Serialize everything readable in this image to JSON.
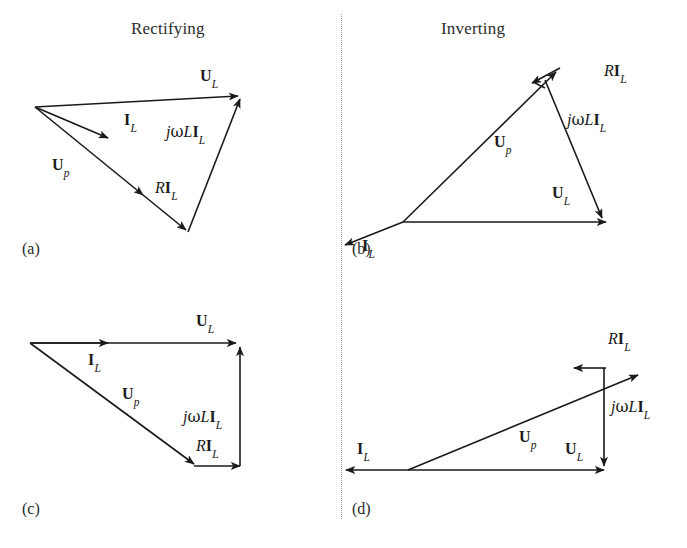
{
  "figure": {
    "width": 687,
    "height": 548,
    "background": "#ffffff",
    "stroke_color": "#1a1a1a",
    "divider": {
      "name": "vertical-dotted-divider",
      "style": "dotted",
      "color": "#9a9a9a"
    }
  },
  "columns": [
    {
      "id": "left",
      "title": "Rectifying"
    },
    {
      "id": "right",
      "title": "Inverting"
    }
  ],
  "titles": {
    "rectifying": "Rectifying",
    "inverting": "Inverting"
  },
  "captions": {
    "a": "(a)",
    "b": "(b)",
    "c": "(c)",
    "d": "(d)"
  },
  "symbols": {
    "U_L": {
      "bold": "U",
      "sub": "L",
      "plain": "U_L"
    },
    "U_p": {
      "bold": "U",
      "sub": "p",
      "plain": "U_p"
    },
    "I_L": {
      "bold": "I",
      "sub": "L",
      "plain": "I_L"
    },
    "R_I_L": {
      "italic": "R",
      "bold": "I",
      "sub": "L",
      "plain": "RI_L"
    },
    "jwL_I_L": {
      "italic_j": "j",
      "greek": "ω",
      "italic_L": "L",
      "bold": "I",
      "sub": "L",
      "plain": "jωLI_L"
    }
  },
  "panels": [
    {
      "id": "a",
      "caption": "(a)",
      "column": "Rectifying",
      "description": "Rectifying phasor triangle with tilted U_L baseline",
      "vectors": [
        {
          "name": "U_L",
          "label": "U_L",
          "from": [
            35,
            107
          ],
          "to": [
            243,
            96
          ],
          "arrow": "end"
        },
        {
          "name": "I_L",
          "label": "I_L",
          "from": [
            35,
            107
          ],
          "to": [
            113,
            140
          ],
          "arrow": "end"
        },
        {
          "name": "U_p",
          "label": "U_p",
          "from": [
            35,
            107
          ],
          "to": [
            190,
            232
          ],
          "arrow": "mid-and-end"
        },
        {
          "name": "R_I_L",
          "label": "RI_L",
          "from": [
            35,
            107
          ],
          "to": [
            190,
            232
          ],
          "arrow": "end"
        },
        {
          "name": "jwL_I_L",
          "label": "jωLI_L",
          "from": [
            190,
            232
          ],
          "to": [
            243,
            96
          ],
          "arrow": "end"
        }
      ],
      "labels": [
        {
          "name": "label-U-L",
          "symbol": "U_L",
          "x": 200,
          "y": 76
        },
        {
          "name": "label-I-L",
          "symbol": "I_L",
          "x": 124,
          "y": 118
        },
        {
          "name": "label-U-p",
          "symbol": "U_p",
          "x": 53,
          "y": 160
        },
        {
          "name": "label-jwL-I-L",
          "symbol": "jωLI_L",
          "x": 167,
          "y": 125
        },
        {
          "name": "label-R-I-L",
          "symbol": "RI_L",
          "x": 156,
          "y": 182
        }
      ]
    },
    {
      "id": "b",
      "caption": "(b)",
      "column": "Inverting",
      "description": "Inverting phasor triangle, R I_L reversed at U_p tip, I_L pointing down-left",
      "vectors": [
        {
          "name": "U_p",
          "label": "U_p",
          "from": [
            403,
            222
          ],
          "to": [
            550,
            78
          ],
          "arrow": "end"
        },
        {
          "name": "R_I_L",
          "label": "RI_L",
          "from": [
            558,
            70
          ],
          "to": [
            533,
            82
          ],
          "arrow": "end"
        },
        {
          "name": "jwL_I_L",
          "label": "jωLI_L",
          "from": [
            548,
            80
          ],
          "to": [
            604,
            218
          ],
          "arrow": "end"
        },
        {
          "name": "U_L",
          "label": "U_L",
          "from": [
            403,
            222
          ],
          "to": [
            604,
            222
          ],
          "arrow": "end"
        },
        {
          "name": "I_L",
          "label": "I_L",
          "from": [
            403,
            222
          ],
          "to": [
            344,
            245
          ],
          "arrow": "end"
        }
      ],
      "labels": [
        {
          "name": "label-R-I-L",
          "symbol": "RI_L",
          "x": 605,
          "y": 70
        },
        {
          "name": "label-jwL-I-L",
          "symbol": "jωLI_L",
          "x": 566,
          "y": 118
        },
        {
          "name": "label-U-p",
          "symbol": "U_p",
          "x": 495,
          "y": 140
        },
        {
          "name": "label-U-L",
          "symbol": "U_L",
          "x": 553,
          "y": 190
        },
        {
          "name": "label-I-L",
          "symbol": "I_L",
          "x": 362,
          "y": 243
        }
      ]
    },
    {
      "id": "c",
      "caption": "(c)",
      "column": "Rectifying",
      "description": "Rectifying phasor with horizontal U_L and vertical jwL I_L leg",
      "vectors": [
        {
          "name": "U_L",
          "label": "U_L",
          "from": [
            30,
            343
          ],
          "to": [
            238,
            343
          ],
          "arrow": "mid-and-end"
        },
        {
          "name": "I_L",
          "label": "I_L",
          "from": [
            30,
            343
          ],
          "to": [
            110,
            343
          ],
          "arrow": "end"
        },
        {
          "name": "U_p",
          "label": "U_p",
          "from": [
            30,
            343
          ],
          "to": [
            197,
            465
          ],
          "arrow": "end"
        },
        {
          "name": "R_I_L",
          "label": "RI_L",
          "from": [
            197,
            465
          ],
          "to": [
            240,
            465
          ],
          "arrow": "end"
        },
        {
          "name": "jwL_I_L",
          "label": "jωLI_L",
          "from": [
            240,
            465
          ],
          "to": [
            240,
            348
          ],
          "arrow": "end"
        }
      ],
      "labels": [
        {
          "name": "label-U-L",
          "symbol": "U_L",
          "x": 196,
          "y": 321
        },
        {
          "name": "label-I-L",
          "symbol": "I_L",
          "x": 88,
          "y": 357
        },
        {
          "name": "label-U-p",
          "symbol": "U_p",
          "x": 123,
          "y": 392
        },
        {
          "name": "label-jwL-I-L",
          "symbol": "jωLI_L",
          "x": 184,
          "y": 415
        },
        {
          "name": "label-R-I-L",
          "symbol": "RI_L",
          "x": 196,
          "y": 444
        }
      ]
    },
    {
      "id": "d",
      "caption": "(d)",
      "column": "Inverting",
      "description": "Inverting phasor with reversed I_L, vertical downward jwL I_L and reversed R I_L",
      "vectors": [
        {
          "name": "U_p",
          "label": "U_p",
          "from": [
            408,
            470
          ],
          "to": [
            638,
            378
          ],
          "arrow": "end"
        },
        {
          "name": "R_I_L",
          "label": "RI_L",
          "from": [
            604,
            368
          ],
          "to": [
            573,
            368
          ],
          "arrow": "end"
        },
        {
          "name": "jwL_I_L",
          "label": "jωLI_L",
          "from": [
            604,
            368
          ],
          "to": [
            604,
            466
          ],
          "arrow": "end"
        },
        {
          "name": "U_L",
          "label": "U_L",
          "from": [
            408,
            470
          ],
          "to": [
            604,
            470
          ],
          "arrow": "end"
        },
        {
          "name": "I_L",
          "label": "I_L",
          "from": [
            408,
            470
          ],
          "to": [
            344,
            470
          ],
          "arrow": "end"
        }
      ],
      "labels": [
        {
          "name": "label-R-I-L",
          "symbol": "RI_L",
          "x": 608,
          "y": 337
        },
        {
          "name": "label-jwL-I-L",
          "symbol": "jωLI_L",
          "x": 612,
          "y": 405
        },
        {
          "name": "label-U-p",
          "symbol": "U_p",
          "x": 520,
          "y": 435
        },
        {
          "name": "label-U-L",
          "symbol": "U_L",
          "x": 566,
          "y": 447
        },
        {
          "name": "label-I-L",
          "symbol": "I_L",
          "x": 358,
          "y": 447
        }
      ]
    }
  ]
}
